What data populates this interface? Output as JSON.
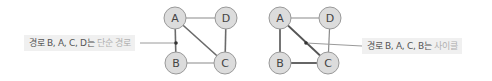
{
  "diagrams": [
    {
      "id": "simple-path",
      "nodes": [
        {
          "label": "A",
          "x": 175,
          "y": 18
        },
        {
          "label": "D",
          "x": 226,
          "y": 18
        },
        {
          "label": "B",
          "x": 176,
          "y": 63
        },
        {
          "label": "C",
          "x": 225,
          "y": 63
        }
      ],
      "edges": [
        [
          "A",
          "D"
        ],
        [
          "A",
          "B"
        ],
        [
          "A",
          "C"
        ],
        [
          "D",
          "C"
        ],
        [
          "B",
          "C"
        ]
      ],
      "highlighted_edges": [],
      "callout": {
        "text_main": "경로 B, A, C, D는 ",
        "text_emphasis": "단순 경로"
      }
    },
    {
      "id": "cycle",
      "nodes": [
        {
          "label": "A",
          "x": 280,
          "y": 18
        },
        {
          "label": "D",
          "x": 330,
          "y": 18
        },
        {
          "label": "B",
          "x": 280,
          "y": 63
        },
        {
          "label": "C",
          "x": 328,
          "y": 63
        }
      ],
      "edges": [
        [
          "A",
          "D"
        ],
        [
          "A",
          "B"
        ],
        [
          "A",
          "C"
        ],
        [
          "D",
          "C"
        ],
        [
          "B",
          "C"
        ]
      ],
      "highlighted_edges": [
        [
          "B",
          "A"
        ],
        [
          "A",
          "C"
        ],
        [
          "C",
          "B"
        ]
      ],
      "callout": {
        "text_main": "경로 B, A, C, B는 ",
        "text_emphasis": "사이클"
      }
    }
  ],
  "colors": {
    "node_fill": "#dcdcdc",
    "node_stroke": "#999999",
    "edge": "#888888",
    "edge_highlight": "#666666",
    "callout_bg": "#f0f0f0",
    "callout_text": "#555555",
    "callout_emphasis": "#b0b0b0"
  }
}
